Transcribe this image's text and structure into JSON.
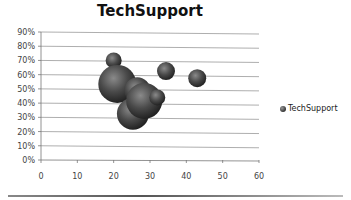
{
  "chart_data": {
    "type": "bubble",
    "title": "TechSupport",
    "xlabel": "",
    "ylabel": "",
    "xlim": [
      0,
      60
    ],
    "ylim": [
      0,
      0.9
    ],
    "x_ticks": [
      "0",
      "10",
      "20",
      "30",
      "40",
      "50",
      "60"
    ],
    "y_ticks": [
      "0%",
      "10%",
      "20%",
      "30%",
      "40%",
      "50%",
      "60%",
      "70%",
      "80%",
      "90%"
    ],
    "grid": true,
    "legend_position": "right",
    "legend": [
      "TechSupport"
    ],
    "series": [
      {
        "name": "TechSupport",
        "points": [
          {
            "x": 20,
            "y": 0.7,
            "size": 8
          },
          {
            "x": 21,
            "y": 0.535,
            "size": 19
          },
          {
            "x": 26.5,
            "y": 0.49,
            "size": 13
          },
          {
            "x": 25.3,
            "y": 0.325,
            "size": 16
          },
          {
            "x": 28.4,
            "y": 0.415,
            "size": 18
          },
          {
            "x": 32,
            "y": 0.44,
            "size": 8
          },
          {
            "x": 34.4,
            "y": 0.625,
            "size": 9
          },
          {
            "x": 43,
            "y": 0.575,
            "size": 9
          }
        ]
      }
    ]
  },
  "legend_label": "TechSupport"
}
